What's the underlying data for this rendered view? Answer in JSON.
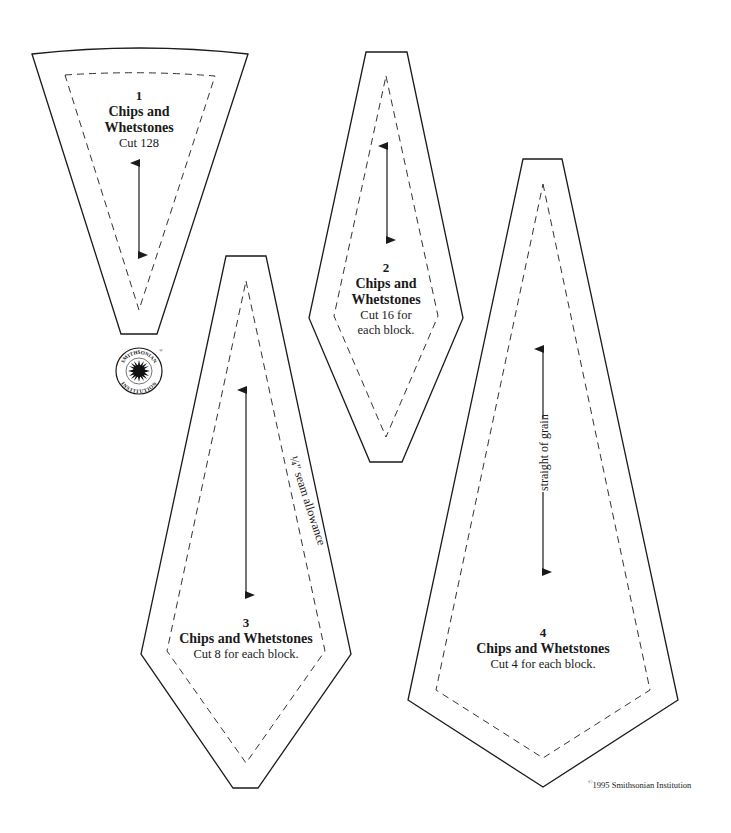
{
  "page": {
    "background": "#ffffff",
    "line_color": "#1a1a1a"
  },
  "pieces": [
    {
      "number": "1",
      "name": "Chips and Whetstones",
      "cut": "Cut 128"
    },
    {
      "number": "2",
      "name_line1": "Chips and",
      "name_line2": "Whetstones",
      "cut_line1": "Cut 16 for",
      "cut_line2": "each block."
    },
    {
      "number": "3",
      "name": "Chips and Whetstones",
      "cut": "Cut 8 for each block."
    },
    {
      "number": "4",
      "name": "Chips and Whetstones",
      "cut": "Cut 4 for each block."
    }
  ],
  "piece1_name_line1": "Chips and",
  "piece1_name_line2": "Whetstones",
  "annotations": {
    "seam_allowance": "¼\" seam allowance",
    "grain": "straight of grain"
  },
  "logo": {
    "top_text": "SMITHSONIAN",
    "bottom_text": "INSTITUTION",
    "registered": "®"
  },
  "copyright": {
    "symbol": "©",
    "text": "1995 Smithsonian Institution"
  }
}
